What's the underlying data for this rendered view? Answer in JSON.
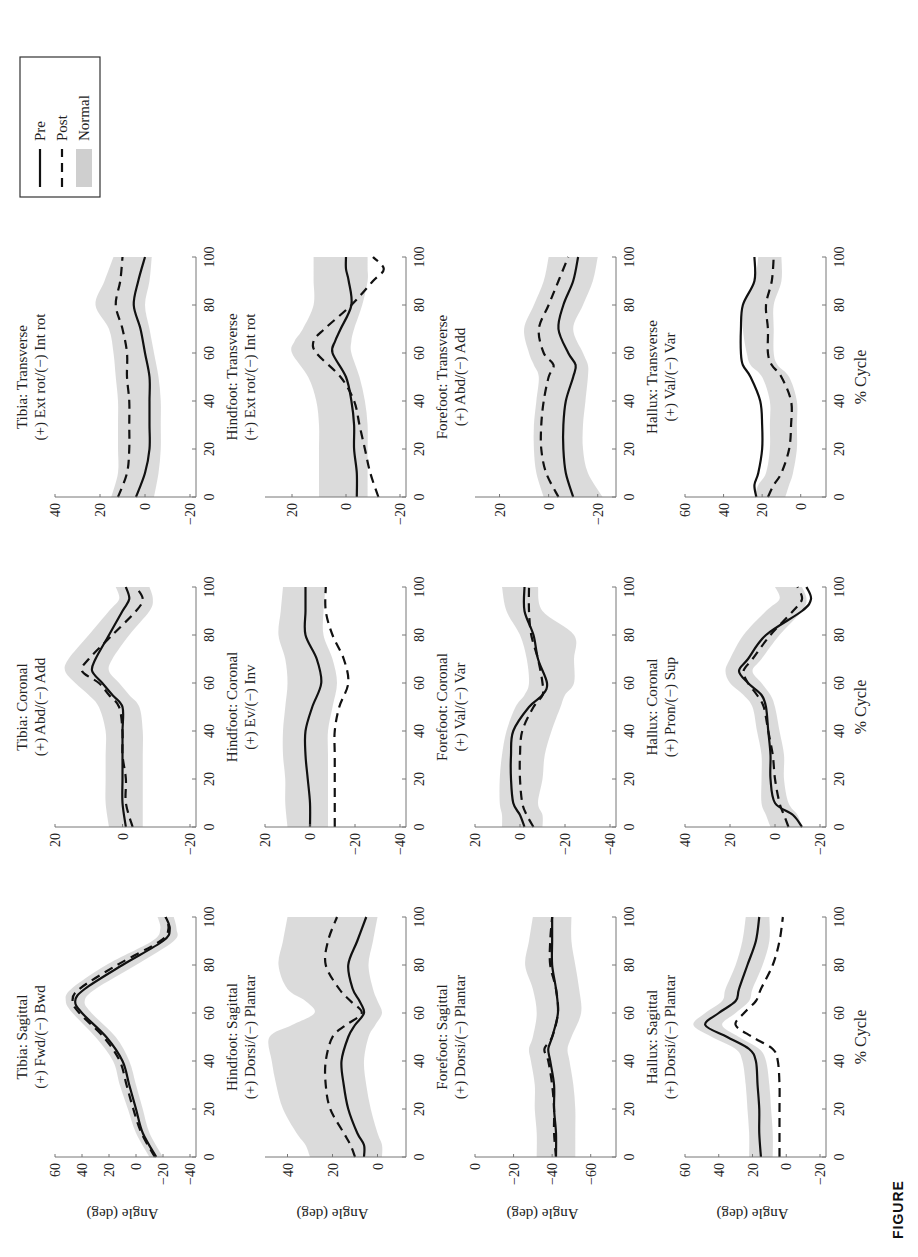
{
  "figure": {
    "caption_visible": "FIGURE",
    "x_axis_label": "% Cycle",
    "y_axis_label": "Angle (deg)",
    "legend": {
      "items": [
        {
          "label": "Pre",
          "style": "solid"
        },
        {
          "label": "Post",
          "style": "dashed"
        },
        {
          "label": "Normal",
          "style": "band"
        }
      ]
    },
    "colors": {
      "line": "#111111",
      "band": "#cfcfcf",
      "axis": "#777777"
    }
  },
  "chart_data": [
    {
      "type": "line",
      "row": "Tibia",
      "col": "Sagittal",
      "title": "Tibia: Sagittal",
      "subtitle": "(+) Fwd/(−) Bwd",
      "ylim": [
        -40,
        60
      ],
      "yticks": [
        -40,
        -20,
        0,
        20,
        40,
        60
      ],
      "x": [
        0,
        10,
        20,
        30,
        40,
        50,
        60,
        65,
        70,
        80,
        90,
        95,
        100
      ],
      "series": [
        {
          "name": "Pre",
          "values": [
            -15,
            -5,
            0,
            5,
            10,
            22,
            40,
            45,
            38,
            10,
            -20,
            -25,
            -22
          ]
        },
        {
          "name": "Post",
          "values": [
            -14,
            -4,
            2,
            7,
            12,
            24,
            42,
            47,
            42,
            14,
            -18,
            -24,
            -22
          ]
        }
      ],
      "normal_band": {
        "lower": [
          -20,
          -10,
          -5,
          0,
          5,
          15,
          33,
          38,
          30,
          0,
          -28,
          -30,
          -28
        ],
        "upper": [
          -10,
          0,
          6,
          12,
          17,
          30,
          47,
          52,
          48,
          22,
          -12,
          -18,
          -16
        ]
      }
    },
    {
      "type": "line",
      "row": "Tibia",
      "col": "Coronal",
      "title": "Tibia: Coronal",
      "subtitle": "(+) Abd/(−) Add",
      "ylim": [
        -20,
        20
      ],
      "yticks": [
        -20,
        0,
        20
      ],
      "x": [
        0,
        10,
        20,
        30,
        40,
        50,
        55,
        60,
        65,
        70,
        80,
        90,
        95,
        100
      ],
      "series": [
        {
          "name": "Pre",
          "values": [
            -1,
            0,
            0,
            0,
            0,
            0,
            3,
            6,
            9,
            8,
            4,
            0,
            -2,
            -1
          ]
        },
        {
          "name": "Post",
          "values": [
            -3,
            -1,
            -1,
            0,
            0,
            1,
            4,
            7,
            12,
            10,
            3,
            -4,
            -6,
            -4
          ]
        }
      ],
      "normal_band": {
        "lower": [
          -6,
          -6,
          -6,
          -6,
          -6,
          -5,
          -2,
          1,
          4,
          3,
          -2,
          -8,
          -9,
          -8
        ],
        "upper": [
          4,
          5,
          5,
          5,
          5,
          7,
          10,
          14,
          17,
          16,
          10,
          4,
          1,
          2
        ]
      }
    },
    {
      "type": "line",
      "row": "Tibia",
      "col": "Transverse",
      "title": "Tibia: Transverse",
      "subtitle": "(+) Ext rot/(−) Int rot",
      "ylim": [
        -20,
        40
      ],
      "yticks": [
        -20,
        0,
        20,
        40
      ],
      "x": [
        0,
        10,
        20,
        30,
        40,
        50,
        60,
        70,
        80,
        90,
        100
      ],
      "series": [
        {
          "name": "Pre",
          "values": [
            4,
            0,
            -2,
            -2,
            -2,
            -2,
            0,
            2,
            5,
            3,
            0
          ]
        },
        {
          "name": "Post",
          "values": [
            12,
            8,
            7,
            7,
            7,
            8,
            8,
            10,
            13,
            11,
            10
          ]
        }
      ],
      "normal_band": {
        "lower": [
          -4,
          -6,
          -7,
          -7,
          -7,
          -6,
          -4,
          -2,
          0,
          -2,
          -3
        ],
        "upper": [
          15,
          12,
          12,
          12,
          12,
          13,
          14,
          16,
          22,
          18,
          14
        ]
      }
    },
    {
      "type": "line",
      "row": "Hindfoot",
      "col": "Sagittal",
      "title": "Hindfoot: Sagittal",
      "subtitle": "(+) Dorsi/(−) Plantar",
      "ylim": [
        -10,
        50
      ],
      "yticks": [
        0,
        20,
        40
      ],
      "x": [
        0,
        5,
        10,
        20,
        30,
        40,
        50,
        55,
        60,
        65,
        70,
        80,
        90,
        100
      ],
      "series": [
        {
          "name": "Pre",
          "values": [
            6,
            6,
            9,
            13,
            15,
            16,
            13,
            10,
            6,
            8,
            11,
            13,
            9,
            5
          ]
        },
        {
          "name": "Post",
          "values": [
            10,
            12,
            15,
            21,
            23,
            23,
            20,
            14,
            7,
            12,
            17,
            23,
            22,
            18
          ]
        }
      ],
      "normal_band": {
        "lower": [
          -2,
          -2,
          0,
          3,
          5,
          6,
          4,
          1,
          -2,
          0,
          2,
          4,
          2,
          0
        ],
        "upper": [
          30,
          32,
          36,
          42,
          45,
          47,
          48,
          38,
          28,
          32,
          40,
          44,
          42,
          40
        ]
      }
    },
    {
      "type": "line",
      "row": "Hindfoot",
      "col": "Coronal",
      "title": "Hindfoot: Coronal",
      "subtitle": "(+) Ev/(−) Inv",
      "ylim": [
        -40,
        20
      ],
      "yticks": [
        -40,
        -20,
        0,
        20
      ],
      "x": [
        0,
        10,
        20,
        30,
        40,
        50,
        60,
        70,
        80,
        90,
        100
      ],
      "series": [
        {
          "name": "Pre",
          "values": [
            0,
            0,
            1,
            2,
            2,
            -1,
            -5,
            -3,
            2,
            2,
            2
          ]
        },
        {
          "name": "Post",
          "values": [
            -11,
            -11,
            -11,
            -11,
            -11,
            -13,
            -17,
            -15,
            -10,
            -7,
            -7
          ]
        }
      ],
      "normal_band": {
        "lower": [
          -8,
          -8,
          -8,
          -8,
          -8,
          -10,
          -12,
          -10,
          -6,
          -6,
          -7
        ],
        "upper": [
          10,
          11,
          11,
          12,
          12,
          11,
          10,
          11,
          14,
          13,
          12
        ]
      }
    },
    {
      "type": "line",
      "row": "Hindfoot",
      "col": "Transverse",
      "title": "Hindfoot: Transverse",
      "subtitle": "(+) Ext rot/(−) Int rot",
      "ylim": [
        -20,
        30
      ],
      "yticks": [
        -20,
        0,
        20
      ],
      "x": [
        0,
        10,
        20,
        30,
        40,
        50,
        60,
        65,
        70,
        80,
        90,
        95,
        100
      ],
      "series": [
        {
          "name": "Pre",
          "values": [
            -4,
            -4,
            -3,
            -3,
            -2,
            0,
            5,
            4,
            2,
            -2,
            -1,
            0,
            0
          ]
        },
        {
          "name": "Post",
          "values": [
            -12,
            -9,
            -7,
            -5,
            -3,
            2,
            11,
            12,
            8,
            -2,
            -10,
            -14,
            -10
          ]
        }
      ],
      "normal_band": {
        "lower": [
          -8,
          -8,
          -8,
          -8,
          -7,
          -5,
          -2,
          -2,
          -3,
          -6,
          -8,
          -8,
          -8
        ],
        "upper": [
          10,
          10,
          10,
          10,
          11,
          14,
          20,
          19,
          16,
          12,
          12,
          12,
          12
        ]
      }
    },
    {
      "type": "line",
      "row": "Forefoot",
      "col": "Sagittal",
      "title": "Forefoot: Sagittal",
      "subtitle": "(+) Dorsi/(−) Plantar",
      "ylim": [
        -70,
        0
      ],
      "yticks": [
        -60,
        -40,
        -20,
        0
      ],
      "x": [
        0,
        10,
        20,
        30,
        40,
        45,
        50,
        60,
        70,
        80,
        90,
        100
      ],
      "series": [
        {
          "name": "Pre",
          "values": [
            -42,
            -42,
            -41,
            -41,
            -39,
            -38,
            -40,
            -43,
            -42,
            -40,
            -40,
            -40
          ]
        },
        {
          "name": "Post",
          "values": [
            -42,
            -41,
            -41,
            -40,
            -38,
            -36,
            -40,
            -43,
            -42,
            -39,
            -39,
            -40
          ]
        }
      ],
      "normal_band": {
        "lower": [
          -52,
          -52,
          -52,
          -51,
          -49,
          -48,
          -50,
          -55,
          -54,
          -52,
          -50,
          -50
        ],
        "upper": [
          -32,
          -32,
          -31,
          -31,
          -29,
          -28,
          -30,
          -32,
          -30,
          -26,
          -28,
          -30
        ]
      }
    },
    {
      "type": "line",
      "row": "Forefoot",
      "col": "Coronal",
      "title": "Forefoot: Coronal",
      "subtitle": "(+) Val/(−) Var",
      "ylim": [
        -40,
        20
      ],
      "yticks": [
        -40,
        -20,
        0,
        20
      ],
      "x": [
        0,
        5,
        10,
        20,
        30,
        40,
        50,
        55,
        60,
        70,
        80,
        90,
        100
      ],
      "series": [
        {
          "name": "Pre",
          "values": [
            -2,
            0,
            3,
            4,
            4,
            3,
            -4,
            -10,
            -12,
            -8,
            -6,
            -2,
            -2
          ]
        },
        {
          "name": "Post",
          "values": [
            -6,
            -3,
            -1,
            0,
            0,
            -1,
            -6,
            -10,
            -10,
            -8,
            -5,
            -4,
            -4
          ]
        }
      ],
      "normal_band": {
        "lower": [
          -10,
          -10,
          -8,
          -10,
          -11,
          -14,
          -18,
          -20,
          -24,
          -24,
          -24,
          -10,
          -8
        ],
        "upper": [
          8,
          8,
          9,
          9,
          8,
          6,
          2,
          -2,
          -4,
          -3,
          0,
          6,
          8
        ]
      }
    },
    {
      "type": "line",
      "row": "Forefoot",
      "col": "Transverse",
      "title": "Forefoot: Transverse",
      "subtitle": "(+) Abd/(−) Add",
      "ylim": [
        -25,
        30
      ],
      "yticks": [
        -20,
        0,
        20
      ],
      "x": [
        0,
        10,
        20,
        30,
        40,
        50,
        55,
        60,
        70,
        80,
        90,
        100
      ],
      "series": [
        {
          "name": "Pre",
          "values": [
            -10,
            -7,
            -6,
            -6,
            -7,
            -10,
            -11,
            -8,
            -4,
            -6,
            -10,
            -12
          ]
        },
        {
          "name": "Post",
          "values": [
            -4,
            1,
            3,
            3,
            2,
            0,
            -2,
            2,
            4,
            0,
            -4,
            -8
          ]
        }
      ],
      "normal_band": {
        "lower": [
          -22,
          -16,
          -14,
          -14,
          -15,
          -16,
          -16,
          -14,
          -10,
          -14,
          -18,
          -20
        ],
        "upper": [
          2,
          5,
          6,
          6,
          5,
          4,
          6,
          8,
          10,
          6,
          2,
          0
        ]
      }
    },
    {
      "type": "line",
      "row": "Hallux",
      "col": "Sagittal",
      "title": "Hallux: Sagittal",
      "subtitle": "(+) Dorsi/(−) Plantar",
      "ylim": [
        -20,
        60
      ],
      "yticks": [
        -20,
        0,
        20,
        40,
        60
      ],
      "x": [
        0,
        10,
        20,
        30,
        40,
        45,
        50,
        55,
        60,
        65,
        70,
        80,
        90,
        100
      ],
      "series": [
        {
          "name": "Pre",
          "values": [
            15,
            16,
            16,
            17,
            18,
            22,
            35,
            48,
            40,
            30,
            28,
            23,
            18,
            16
          ]
        },
        {
          "name": "Post",
          "values": [
            4,
            4,
            4,
            4,
            5,
            8,
            20,
            30,
            25,
            18,
            15,
            8,
            4,
            2
          ]
        }
      ],
      "normal_band": {
        "lower": [
          8,
          8,
          9,
          10,
          12,
          16,
          28,
          38,
          30,
          22,
          20,
          14,
          10,
          10
        ],
        "upper": [
          22,
          22,
          23,
          24,
          26,
          30,
          44,
          55,
          48,
          38,
          36,
          30,
          26,
          24
        ]
      }
    },
    {
      "type": "line",
      "row": "Hallux",
      "col": "Coronal",
      "title": "Hallux: Coronal",
      "subtitle": "(+) Pron/(−) Sup",
      "ylim": [
        -20,
        40
      ],
      "yticks": [
        -20,
        0,
        20,
        40
      ],
      "x": [
        0,
        5,
        10,
        20,
        30,
        40,
        50,
        55,
        60,
        65,
        70,
        80,
        90,
        95,
        100
      ],
      "series": [
        {
          "name": "Pre",
          "values": [
            -12,
            -8,
            0,
            2,
            2,
            3,
            4,
            6,
            12,
            16,
            12,
            4,
            -12,
            -16,
            -14
          ]
        },
        {
          "name": "Post",
          "values": [
            -6,
            -4,
            -2,
            0,
            1,
            3,
            5,
            8,
            12,
            14,
            10,
            2,
            -8,
            -12,
            -10
          ]
        }
      ],
      "normal_band": {
        "lower": [
          -12,
          -10,
          -6,
          -4,
          -4,
          -2,
          0,
          2,
          6,
          10,
          6,
          -2,
          -12,
          -14,
          -12
        ],
        "upper": [
          2,
          4,
          6,
          6,
          6,
          8,
          10,
          14,
          20,
          22,
          20,
          14,
          4,
          -2,
          0
        ]
      }
    },
    {
      "type": "line",
      "row": "Hallux",
      "col": "Transverse",
      "title": "Hallux: Transverse",
      "subtitle": "(+) Val/(−) Var",
      "ylim": [
        -10,
        60
      ],
      "yticks": [
        0,
        20,
        40,
        60
      ],
      "x": [
        0,
        5,
        10,
        20,
        30,
        40,
        50,
        55,
        60,
        70,
        80,
        90,
        100
      ],
      "series": [
        {
          "name": "Pre",
          "values": [
            23,
            24,
            22,
            20,
            20,
            21,
            26,
            30,
            31,
            31,
            30,
            24,
            24
          ]
        },
        {
          "name": "Post",
          "values": [
            17,
            14,
            10,
            6,
            5,
            5,
            10,
            15,
            17,
            17,
            18,
            15,
            14
          ]
        }
      ],
      "normal_band": {
        "lower": [
          8,
          6,
          4,
          2,
          2,
          2,
          6,
          12,
          14,
          14,
          14,
          10,
          10
        ],
        "upper": [
          24,
          22,
          18,
          16,
          16,
          16,
          20,
          26,
          28,
          30,
          30,
          24,
          22
        ]
      }
    }
  ]
}
